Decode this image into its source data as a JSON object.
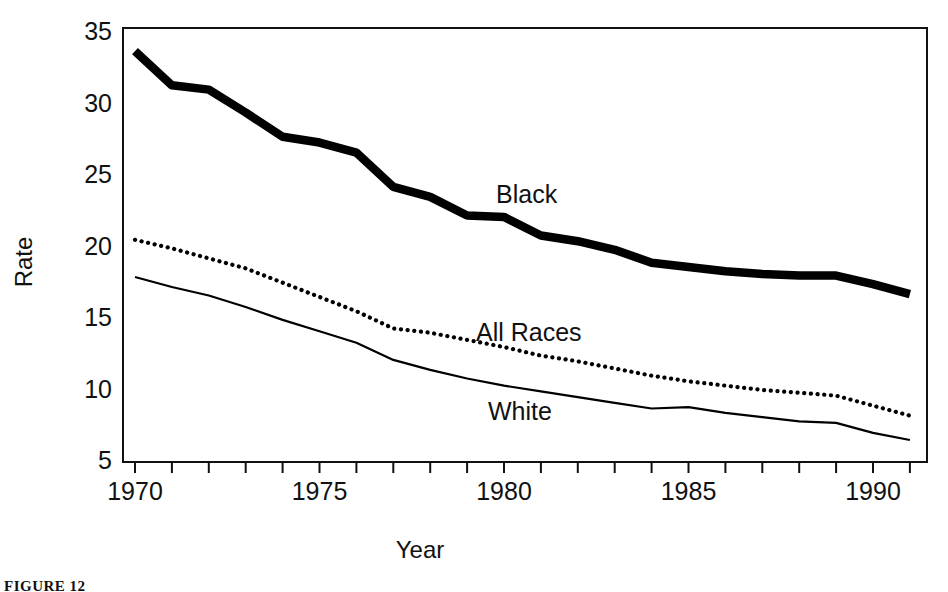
{
  "chart_data": {
    "type": "line",
    "title": "",
    "xlabel": "Year",
    "ylabel": "Rate",
    "xlim": [
      1970,
      1991
    ],
    "ylim": [
      5,
      35
    ],
    "xticks": [
      1970,
      1971,
      1972,
      1973,
      1974,
      1975,
      1976,
      1977,
      1978,
      1979,
      1980,
      1981,
      1982,
      1983,
      1984,
      1985,
      1986,
      1987,
      1988,
      1989,
      1990,
      1991
    ],
    "xtick_labels": [
      "1970",
      "",
      "",
      "",
      "",
      "1975",
      "",
      "",
      "",
      "",
      "1980",
      "",
      "",
      "",
      "",
      "1985",
      "",
      "",
      "",
      "",
      "1990",
      ""
    ],
    "yticks": [
      5,
      10,
      15,
      20,
      25,
      30,
      35
    ],
    "ytick_labels": [
      "5",
      "10",
      "15",
      "20",
      "25",
      "30",
      "35"
    ],
    "grid": false,
    "legend_position": "inline-annotations",
    "x": [
      1970,
      1971,
      1972,
      1973,
      1974,
      1975,
      1976,
      1977,
      1978,
      1979,
      1980,
      1981,
      1982,
      1983,
      1984,
      1985,
      1986,
      1987,
      1988,
      1989,
      1990,
      1991
    ],
    "series": [
      {
        "name": "Black",
        "style": "thick-solid",
        "color": "#000000",
        "label": "Black",
        "values": [
          33.6,
          31.2,
          30.9,
          29.3,
          27.6,
          27.2,
          26.5,
          24.1,
          23.4,
          22.1,
          22.0,
          20.7,
          20.3,
          19.7,
          18.8,
          18.5,
          18.2,
          18.0,
          17.9,
          17.9,
          17.3,
          16.6
        ]
      },
      {
        "name": "All Races",
        "style": "dotted",
        "color": "#000000",
        "label": "All Races",
        "values": [
          20.4,
          19.8,
          19.1,
          18.4,
          17.4,
          16.4,
          15.4,
          14.2,
          13.9,
          13.4,
          12.9,
          12.3,
          11.9,
          11.4,
          10.9,
          10.5,
          10.2,
          9.9,
          9.7,
          9.5,
          8.8,
          8.1
        ]
      },
      {
        "name": "White",
        "style": "thin-solid",
        "color": "#000000",
        "label": "White",
        "values": [
          17.8,
          17.1,
          16.5,
          15.7,
          14.8,
          14.0,
          13.2,
          12.0,
          11.3,
          10.7,
          10.2,
          9.8,
          9.4,
          9.0,
          8.6,
          8.7,
          8.3,
          8.0,
          7.7,
          7.6,
          6.9,
          6.4
        ]
      }
    ]
  },
  "annotations": {
    "black_label": "Black",
    "all_races_label": "All Races",
    "white_label": "White"
  },
  "axes": {
    "y_axis_title": "Rate",
    "x_axis_title": "Year"
  },
  "caption": {
    "fragment": "FIGURE 12"
  }
}
